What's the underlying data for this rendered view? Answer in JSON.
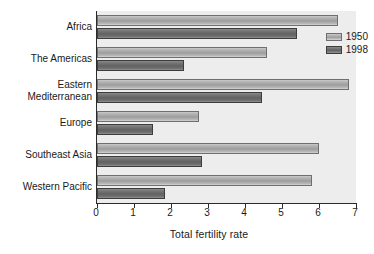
{
  "chart_data": {
    "type": "bar",
    "orientation": "horizontal",
    "title": "",
    "xlabel": "Total fertility rate",
    "ylabel": "",
    "xlim": [
      0,
      7
    ],
    "xticks": [
      "0",
      "1",
      "2",
      "3",
      "4",
      "5",
      "6",
      "7"
    ],
    "grid": false,
    "legend_position": "top-right inside",
    "categories": [
      "Africa",
      "The Americas",
      "Eastern\nMediterranean",
      "Europe",
      "Southeast Asia",
      "Western Pacific"
    ],
    "series": [
      {
        "name": "1950",
        "color": "#a8a8a8",
        "values": [
          6.5,
          4.6,
          6.8,
          2.75,
          6.0,
          5.8
        ]
      },
      {
        "name": "1998",
        "color": "#6b6b6b",
        "values": [
          5.4,
          2.35,
          4.45,
          1.5,
          2.85,
          1.85
        ]
      }
    ]
  },
  "legend": {
    "items": [
      "1950",
      "1998"
    ]
  },
  "axis": {
    "x_title": "Total fertility rate",
    "tick_labels": [
      "0",
      "1",
      "2",
      "3",
      "4",
      "5",
      "6",
      "7"
    ]
  },
  "category_labels": [
    {
      "line1": "Africa",
      "line2": ""
    },
    {
      "line1": "The Americas",
      "line2": ""
    },
    {
      "line1": "Eastern",
      "line2": "Mediterranean"
    },
    {
      "line1": "Europe",
      "line2": ""
    },
    {
      "line1": "Southeast Asia",
      "line2": ""
    },
    {
      "line1": "Western Pacific",
      "line2": ""
    }
  ]
}
